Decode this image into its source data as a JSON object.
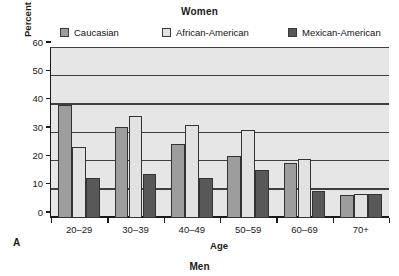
{
  "panel": {
    "title": "Women",
    "letter": "A",
    "footer_title": "Men"
  },
  "legend": {
    "items": [
      {
        "label": "Caucasian",
        "color": "#9d9d9d"
      },
      {
        "label": "African-American",
        "color": "#e2e2e2"
      },
      {
        "label": "Mexican-American",
        "color": "#585858"
      }
    ]
  },
  "axes": {
    "y_label": "Percent current smokers",
    "x_label": "Age",
    "y_ticks": [
      "0",
      "10",
      "20",
      "30",
      "40",
      "50",
      "60"
    ]
  },
  "chart_data": {
    "type": "bar",
    "title": "Women",
    "xlabel": "Age",
    "ylabel": "Percent current smokers",
    "ylim": [
      0,
      60
    ],
    "ytick_step": 10,
    "grid": true,
    "legend_position": "top",
    "categories": [
      "20–29",
      "30–39",
      "40–49",
      "50–59",
      "60–69",
      "70+"
    ],
    "series": [
      {
        "name": "Caucasian",
        "color": "#9d9d9d",
        "values": [
          40,
          32,
          26,
          22,
          19.5,
          8
        ]
      },
      {
        "name": "African-American",
        "color": "#e2e2e2",
        "values": [
          25,
          36,
          33,
          31,
          21,
          8.5
        ]
      },
      {
        "name": "Mexican-American",
        "color": "#585858",
        "values": [
          14,
          15.5,
          14,
          17,
          9.5,
          8.5
        ]
      }
    ]
  }
}
